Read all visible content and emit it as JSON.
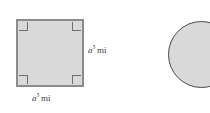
{
  "figure": {
    "background_color": "#ffffff",
    "shapes": [
      {
        "name": "square",
        "fill_color": "#d9d9d9",
        "stroke_color": "#8c8c8c",
        "right_angle_markers": 4
      },
      {
        "name": "circle",
        "fill_color": "#d9d9d9",
        "stroke_color": "#4a4a4a",
        "clipped": "right edge"
      }
    ],
    "labels": {
      "right_side": {
        "base": "a",
        "exponent": "5",
        "unit": "mi"
      },
      "bottom_side": {
        "base": "a",
        "exponent": "5",
        "unit": "mi"
      }
    }
  }
}
